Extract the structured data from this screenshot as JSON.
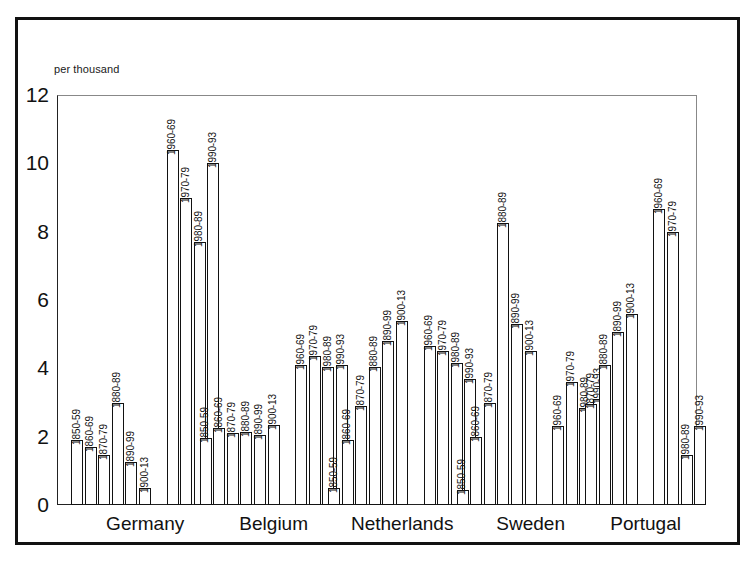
{
  "chart_data": {
    "type": "bar",
    "title": "",
    "subtitle": "",
    "unit_caption": "per thousand",
    "xlabel": "",
    "ylabel": "",
    "ylim": [
      0,
      12
    ],
    "ytick_values": [
      0,
      2,
      4,
      6,
      8,
      10,
      12
    ],
    "ytick_labels": [
      "0",
      "2",
      "4",
      "6",
      "8",
      "10",
      "12"
    ],
    "grid": false,
    "legend": "none",
    "orientation": "vertical",
    "bar_style": "white fill, black outline",
    "groups": [
      {
        "name": "Germany",
        "subgroups": [
          {
            "bars": [
              {
                "label": "1850-59",
                "value": 1.9
              },
              {
                "label": "1860-69",
                "value": 1.7
              },
              {
                "label": "1870-79",
                "value": 1.45
              },
              {
                "label": "1880-89",
                "value": 3.0
              },
              {
                "label": "1890-99",
                "value": 1.25
              },
              {
                "label": "1900-13",
                "value": 0.5
              }
            ]
          },
          {
            "bars": [
              {
                "label": "1960-69",
                "value": 10.4
              },
              {
                "label": "1970-79",
                "value": 9.0
              },
              {
                "label": "1980-89",
                "value": 7.7
              },
              {
                "label": "1990-93",
                "value": 10.0
              }
            ]
          }
        ]
      },
      {
        "name": "Belgium",
        "subgroups": [
          {
            "bars": [
              {
                "label": "1850-59",
                "value": 1.95
              },
              {
                "label": "1860-69",
                "value": 2.25
              },
              {
                "label": "1870-79",
                "value": 2.1
              },
              {
                "label": "1880-89",
                "value": 2.15
              },
              {
                "label": "1890-99",
                "value": 2.05
              },
              {
                "label": "1900-13",
                "value": 2.35
              }
            ]
          },
          {
            "bars": [
              {
                "label": "1960-69",
                "value": 4.1
              },
              {
                "label": "1970-79",
                "value": 4.35
              },
              {
                "label": "1980-89",
                "value": 4.05
              },
              {
                "label": "1990-93",
                "value": 4.1
              }
            ]
          }
        ]
      },
      {
        "name": "Netherlands",
        "subgroups": [
          {
            "bars": [
              {
                "label": "1850-59",
                "value": 0.5
              },
              {
                "label": "1860-69",
                "value": 1.9
              },
              {
                "label": "1870-79",
                "value": 2.9
              },
              {
                "label": "1880-89",
                "value": 4.05
              },
              {
                "label": "1890-99",
                "value": 4.8
              },
              {
                "label": "1900-13",
                "value": 5.4
              }
            ]
          },
          {
            "bars": [
              {
                "label": "1960-69",
                "value": 4.65
              },
              {
                "label": "1970-79",
                "value": 4.5
              },
              {
                "label": "1980-89",
                "value": 4.15
              },
              {
                "label": "1990-93",
                "value": 3.7
              }
            ]
          }
        ]
      },
      {
        "name": "Sweden",
        "subgroups": [
          {
            "bars": [
              {
                "label": "1850-59",
                "value": 0.45
              },
              {
                "label": "1860-69",
                "value": 2.0
              },
              {
                "label": "1870-79",
                "value": 3.0
              },
              {
                "label": "1880-89",
                "value": 8.25
              },
              {
                "label": "1890-99",
                "value": 5.3
              },
              {
                "label": "1900-13",
                "value": 4.5
              }
            ]
          },
          {
            "bars": [
              {
                "label": "1960-69",
                "value": 2.3
              },
              {
                "label": "1970-79",
                "value": 3.6
              },
              {
                "label": "1980-89",
                "value": 2.85
              },
              {
                "label": "1990-93",
                "value": 3.1
              }
            ]
          }
        ]
      },
      {
        "name": "Portugal",
        "subgroups": [
          {
            "bars": [
              {
                "label": "1870-79",
                "value": 2.95
              },
              {
                "label": "1880-89",
                "value": 4.1
              },
              {
                "label": "1890-99",
                "value": 5.05
              },
              {
                "label": "1900-13",
                "value": 5.6
              }
            ]
          },
          {
            "bars": [
              {
                "label": "1960-69",
                "value": 8.65
              },
              {
                "label": "1970-79",
                "value": 8.0
              },
              {
                "label": "1980-89",
                "value": 1.45
              },
              {
                "label": "1990-93",
                "value": 2.3
              }
            ]
          }
        ]
      }
    ]
  },
  "colors": {
    "bar_outline": "#121212",
    "bar_fill": "#ffffff",
    "axis": "#111111",
    "frame": "#111111",
    "background": "#ffffff"
  }
}
